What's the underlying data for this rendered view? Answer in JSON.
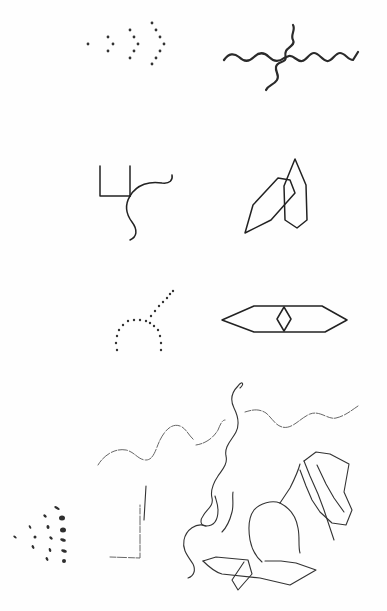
{
  "figure": {
    "background": "#fefefe",
    "ink_color": "#2a2a2a",
    "panels": [
      {
        "id": "dot-chevrons",
        "type": "dots",
        "points": [
          [
            88,
            44
          ],
          [
            108,
            37
          ],
          [
            113,
            44
          ],
          [
            108,
            51
          ],
          [
            130,
            30
          ],
          [
            134,
            37
          ],
          [
            138,
            44
          ],
          [
            134,
            51
          ],
          [
            130,
            58
          ],
          [
            152,
            23
          ],
          [
            156,
            30
          ],
          [
            160,
            37
          ],
          [
            164,
            44
          ],
          [
            160,
            51
          ],
          [
            156,
            58
          ],
          [
            152,
            64
          ]
        ],
        "radius": 1.4
      },
      {
        "id": "wavy-cross",
        "type": "paths",
        "style": "bold",
        "paths": [
          "M224,60 C229,53 234,53 239,57 C244,62 249,62 254,57 C259,52 264,52 269,57 C274,62 279,62 284,58 L289,56 C294,55 297,62 302,61 C307,60 309,53 314,53 C319,53 322,60 327,61 C332,62 335,53 340,53 C345,53 348,60 353,60 L358,52",
          "M293,25 C296,30 290,35 293,40 C296,45 288,47 286,51 C284,55 287,58 285,60 C282,63 277,62 276,67 C275,72 280,75 277,80 C274,85 268,85 266,90"
        ]
      },
      {
        "id": "fork-curve",
        "type": "paths",
        "style": "med",
        "paths": [
          "M100,166 L100,196 L130,196",
          "M130,166 L130,196",
          "M130,196 C137,184 150,181 162,183 C170,184 173,180 172,175",
          "M130,196 C124,206 126,214 132,222 C138,230 137,237 130,240"
        ]
      },
      {
        "id": "crossed-hexagons",
        "type": "polygons",
        "style": "med",
        "polygons": [
          [
            [
              245,
              233
            ],
            [
              253,
              205
            ],
            [
              278,
              178
            ],
            [
              290,
              180
            ],
            [
              295,
              193
            ],
            [
              271,
              220
            ]
          ],
          [
            [
              295,
              159
            ],
            [
              306,
              185
            ],
            [
              307,
              220
            ],
            [
              297,
              228
            ],
            [
              285,
              220
            ],
            [
              284,
              186
            ]
          ]
        ]
      },
      {
        "id": "dotted-arch",
        "type": "dots",
        "points": [
          [
            117,
            350
          ],
          [
            116,
            343
          ],
          [
            117,
            336
          ],
          [
            119,
            330
          ],
          [
            123,
            325
          ],
          [
            128,
            321
          ],
          [
            134,
            320
          ],
          [
            140,
            320
          ],
          [
            146,
            321
          ],
          [
            150,
            323
          ],
          [
            154,
            326
          ],
          [
            158,
            330
          ],
          [
            160,
            336
          ],
          [
            161,
            343
          ],
          [
            161,
            350
          ],
          [
            151,
            316
          ],
          [
            155,
            311
          ],
          [
            159,
            306
          ],
          [
            163,
            302
          ],
          [
            167,
            298
          ],
          [
            170,
            294
          ],
          [
            173,
            291
          ]
        ],
        "radius": 1.2
      },
      {
        "id": "long-hexagon-diamond",
        "type": "polygons",
        "style": "med",
        "polygons": [
          [
            [
              222,
              320
            ],
            [
              254,
              306
            ],
            [
              322,
              306
            ],
            [
              347,
              320
            ],
            [
              325,
              332
            ],
            [
              254,
              332
            ]
          ],
          [
            [
              284,
              307
            ],
            [
              291,
              319
            ],
            [
              284,
              331
            ],
            [
              277,
              319
            ]
          ]
        ]
      },
      {
        "id": "scribble-scene",
        "type": "paths",
        "style": "faint",
        "paths": [
          "M98,465 C104,455 115,448 126,450 C135,452 138,460 146,460 C154,460 156,448 160,440 C165,430 172,423 180,426 C186,428 189,436 194,440",
          "M196,445 C203,444 212,440 218,430 C220,425 222,420 225,420",
          "M245,412 C252,410 258,408 266,413 C272,418 275,425 282,427 C292,430 300,418 310,414 C320,410 328,420 336,418 C345,416 352,410 358,406",
          "M110,557 L140,558 L140,505"
        ]
      },
      {
        "id": "scribble-scene-solid",
        "type": "paths",
        "style": "thin",
        "paths": [
          "M240,388 C245,384 242,380 238,386 C232,392 230,400 234,408 C238,416 240,424 236,432 C232,440 224,446 226,456 C228,464 222,470 218,476 C214,482 210,490 212,498 C214,506 206,510 203,516 C200,520 200,526 206,526 C214,526 218,520 218,510 C218,504 216,500 215,496",
          "M206,526 C196,522 186,530 184,540 C182,550 188,556 193,564 C196,570 194,576 188,578",
          "M233,492 C232,497 234,505 232,512 C230,520 226,528 222,532",
          "M300,464 C298,472 294,480 290,488 C286,494 282,500 280,503",
          "M280,503 C272,500 260,503 254,510 C248,518 248,528 250,540 C252,550 256,557 262,562",
          "M280,503 C290,508 296,516 298,528 C300,538 298,546 300,553",
          "M203,561 C208,566 214,572 222,574 L260,578 L290,585 L316,570 L296,563 L281,561 L265,561",
          "M203,561 L216,557 L248,560 L252,574 L238,590 L232,580 L244,562",
          "M304,461 L310,476 L318,494 L324,510 L330,528 L334,540",
          "M304,461 L316,452 L330,454 L349,464 L344,492 L352,510 L346,525 L332,523 L320,512 L312,500 L306,486 L300,470",
          "M317,465 L326,484 L334,498 L344,512",
          "M146,486 L144,520"
        ]
      },
      {
        "id": "dash-cluster",
        "type": "blobs",
        "items": [
          [
            57,
            508,
            3,
            1.2,
            30
          ],
          [
            45,
            516,
            2,
            1.2,
            40
          ],
          [
            62,
            518,
            3,
            2.5,
            0
          ],
          [
            30,
            527,
            2,
            1,
            60
          ],
          [
            48,
            527,
            2,
            1.5,
            80
          ],
          [
            63,
            530,
            3,
            2.5,
            0
          ],
          [
            15,
            537,
            2,
            1,
            40
          ],
          [
            35,
            537,
            1.5,
            1.5,
            0
          ],
          [
            51,
            538,
            2,
            1.2,
            40
          ],
          [
            63,
            540,
            3,
            1.5,
            20
          ],
          [
            33,
            547,
            2,
            1.2,
            60
          ],
          [
            50,
            550,
            2,
            1.2,
            70
          ],
          [
            64,
            551,
            3,
            1.5,
            20
          ],
          [
            47,
            559,
            2,
            1.2,
            60
          ],
          [
            64,
            561,
            2,
            2,
            0
          ]
        ]
      }
    ]
  }
}
